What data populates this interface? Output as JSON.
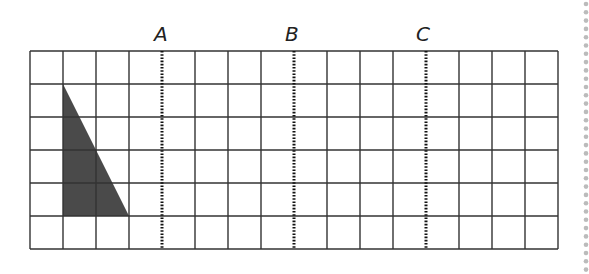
{
  "diagram": {
    "type": "grid-with-reflection-lines",
    "grid": {
      "columns": 16,
      "rows": 6,
      "origin_px": [
        30,
        51
      ],
      "cell_px": 33,
      "line_color": "#333333"
    },
    "lines": [
      {
        "label": "A",
        "after_column": 4,
        "style": "dotted"
      },
      {
        "label": "B",
        "after_column": 8,
        "style": "dotted"
      },
      {
        "label": "C",
        "after_column": 12,
        "style": "dotted"
      }
    ],
    "shape": {
      "name": "right-triangle",
      "fill": "#4a4a4a",
      "vertices_grid": [
        [
          1,
          1
        ],
        [
          1,
          5
        ],
        [
          3,
          5
        ]
      ]
    },
    "margin_dots": {
      "x_px": 586,
      "color": "#bbbbbb"
    }
  }
}
